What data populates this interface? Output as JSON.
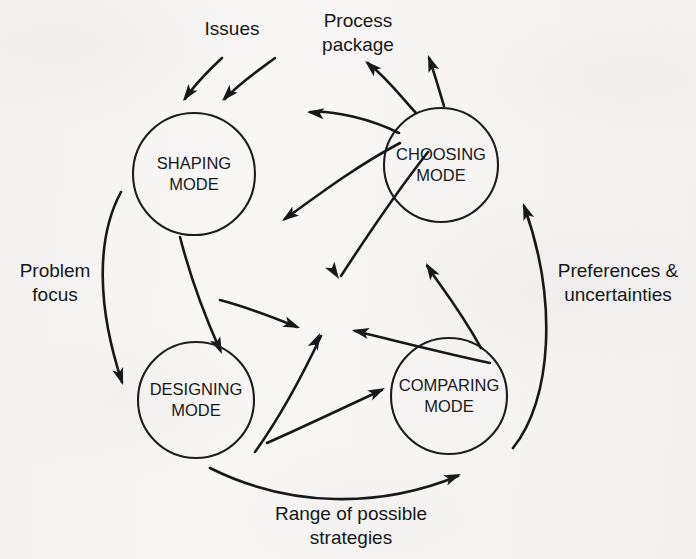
{
  "figure": {
    "kind": "cycle-diagram",
    "background_color": "#f6f5f3",
    "ink_color": "#16181a",
    "width": 696,
    "height": 559
  },
  "nodes": [
    {
      "id": "shaping",
      "line1": "SHAPING",
      "line2": "MODE",
      "cx": 194,
      "cy": 174,
      "rx": 61,
      "ry": 61
    },
    {
      "id": "choosing",
      "line1": "CHOOSING",
      "line2": "MODE",
      "cx": 441,
      "cy": 165,
      "rx": 57,
      "ry": 57
    },
    {
      "id": "designing",
      "line1": "DESIGNING",
      "line2": "MODE",
      "cx": 196,
      "cy": 400,
      "rx": 58,
      "ry": 58
    },
    {
      "id": "comparing",
      "line1": "COMPARING",
      "line2": "MODE",
      "cx": 449,
      "cy": 396,
      "rx": 58,
      "ry": 58
    }
  ],
  "edge_labels": [
    {
      "id": "issues",
      "line1": "Issues",
      "line2": "",
      "x": 232,
      "y": 30
    },
    {
      "id": "process",
      "line1": "Process",
      "line2": "package",
      "x": 358,
      "y": 22
    },
    {
      "id": "problem-focus",
      "line1": "Problem",
      "line2": "focus",
      "x": 55,
      "y": 272
    },
    {
      "id": "preferences",
      "line1": "Preferences &",
      "line2": "uncertainties",
      "x": 618,
      "y": 272
    },
    {
      "id": "range",
      "line1": "Range of possible",
      "line2": "strategies",
      "x": 351,
      "y": 515
    }
  ],
  "links": [
    {
      "id": "issues-left-to-shaping",
      "d": "M 222 58 C 207 72 195 84 185 99"
    },
    {
      "id": "issues-right-to-shaping",
      "d": "M 275 58 C 255 73 238 84 225 99"
    },
    {
      "id": "choosing-to-process-left",
      "d": "M 416 113 C 402 98 389 80 368 63"
    },
    {
      "id": "choosing-to-process-right",
      "d": "M 444 106 C 440 93 436 78 429 58"
    },
    {
      "id": "choosing-to-shaping",
      "d": "M 399 133 C 371 119 333 110 310 112"
    },
    {
      "id": "choosing-to-shaping-lower",
      "d": "M 400 143 C 360 164 322 192 285 219"
    },
    {
      "id": "choosing-to-center",
      "d": "M 428 152 C 395 194 367 236 341 276"
    },
    {
      "id": "shaping-to-center",
      "d": "M 220 300 C 250 308 275 318 297 327"
    },
    {
      "id": "shaping-to-designing",
      "d": "M 180 237 C 190 276 203 312 220 350"
    },
    {
      "id": "designing-to-center",
      "d": "M 255 452 C 285 410 305 370 321 336"
    },
    {
      "id": "comparing-to-center",
      "d": "M 490 363 C 430 350 385 338 355 331"
    },
    {
      "id": "comparing-to-choosing",
      "d": "M 481 348 C 460 310 442 288 427 266"
    },
    {
      "id": "designing-to-comparing",
      "d": "M 267 443 C 310 424 347 406 382 390"
    },
    {
      "id": "shaping-problem-focus",
      "d": "M 121 192 C 95 240 98 310 122 382"
    },
    {
      "id": "designing-range-comparing",
      "d": "M 210 468 C 290 508 380 508 458 476"
    },
    {
      "id": "comparing-preferences",
      "d": "M 513 448 C 552 400 558 300 524 206"
    }
  ],
  "arrowheads": [
    {
      "id": "head-issues-left",
      "x": 183,
      "y": 101,
      "angle": 126
    },
    {
      "id": "head-issues-right",
      "x": 222,
      "y": 101,
      "angle": 133
    },
    {
      "id": "head-process-left",
      "x": 365,
      "y": 61,
      "angle": -138
    },
    {
      "id": "head-process-right",
      "x": 428,
      "y": 55,
      "angle": -110
    },
    {
      "id": "head-choosing-shaping",
      "x": 307,
      "y": 112,
      "angle": 186
    },
    {
      "id": "head-choosing-sh-lower",
      "x": 282,
      "y": 221,
      "angle": 144
    },
    {
      "id": "head-choosing-center",
      "x": 339,
      "y": 279,
      "angle": 57
    },
    {
      "id": "head-shaping-center",
      "x": 300,
      "y": 328,
      "angle": 22
    },
    {
      "id": "head-shaping-designing",
      "x": 222,
      "y": 354,
      "angle": 66
    },
    {
      "id": "head-designing-center",
      "x": 320,
      "y": 333,
      "angle": -65
    },
    {
      "id": "head-comparing-center",
      "x": 352,
      "y": 330,
      "angle": 192
    },
    {
      "id": "head-comparing-choosing",
      "x": 426,
      "y": 263,
      "angle": -122
    },
    {
      "id": "head-designing-compare",
      "x": 385,
      "y": 388,
      "angle": -26
    },
    {
      "id": "head-problem-focus",
      "x": 123,
      "y": 385,
      "angle": 72
    },
    {
      "id": "head-range-strategies",
      "x": 461,
      "y": 474,
      "angle": -22
    },
    {
      "id": "head-preferences",
      "x": 523,
      "y": 203,
      "angle": -110
    }
  ]
}
